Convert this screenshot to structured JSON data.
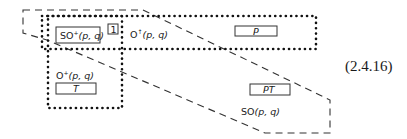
{
  "diagram": {
    "regions": {
      "so_plus": {
        "label": "SO",
        "sup": "+",
        "args": "(p, q)",
        "boxed": true
      },
      "marker": {
        "label": "1",
        "boxed": true
      },
      "o_up": {
        "label": "O",
        "sup": "↑",
        "args": "(p, q)"
      },
      "p_box": {
        "label": "P",
        "boxed": true
      },
      "o_plus_down": {
        "label": "O",
        "sup": "+",
        "args": "(p, q)"
      },
      "t_box": {
        "label": "T",
        "boxed": true
      },
      "pt_box": {
        "label": "PT",
        "boxed": true
      },
      "so_full": {
        "label": "SO",
        "args": "(p, q)"
      }
    },
    "equation_number": "(2.4.16)"
  }
}
